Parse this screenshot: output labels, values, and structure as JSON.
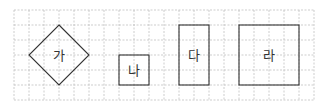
{
  "grid": {
    "columns": 20,
    "rows": 6,
    "line_style": "dashed",
    "line_color": "#b8b8b8"
  },
  "shapes": [
    {
      "id": "ga",
      "label": "가",
      "type": "diamond",
      "cells_wide": 4,
      "cells_tall": 4
    },
    {
      "id": "na",
      "label": "나",
      "type": "square",
      "cells_wide": 2,
      "cells_tall": 2
    },
    {
      "id": "da",
      "label": "다",
      "type": "rectangle",
      "cells_wide": 2,
      "cells_tall": 4
    },
    {
      "id": "ra",
      "label": "라",
      "type": "square",
      "cells_wide": 4,
      "cells_tall": 4
    }
  ],
  "stroke_color": "#333333"
}
